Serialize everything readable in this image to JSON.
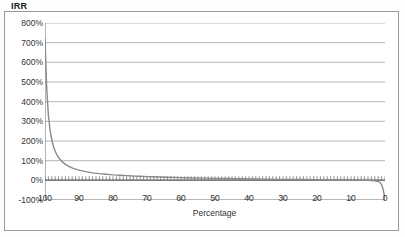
{
  "chart_title": "IRR",
  "x_axis_title": "Percentage",
  "colors": {
    "curve": "#8a8a8a",
    "gridline": "#b4b4b4",
    "axis": "#6e6e6e",
    "frame": "#9a9a9a",
    "text": "#333333",
    "background": "#ffffff"
  },
  "chart_data": {
    "type": "line",
    "title": "IRR",
    "xlabel": "Percentage",
    "ylabel": "",
    "xlim": [
      100,
      0
    ],
    "ylim": [
      -100,
      800
    ],
    "x_reversed": true,
    "grid": true,
    "legend": "none",
    "ytick_labels": [
      "800%",
      "700%",
      "600%",
      "500%",
      "400%",
      "300%",
      "200%",
      "100%",
      "0%",
      "-100%"
    ],
    "ytick_values": [
      800,
      700,
      600,
      500,
      400,
      300,
      200,
      100,
      0,
      -100
    ],
    "ytick_suffix": "%",
    "ytick_step": 100,
    "xtick_labels": [
      "100",
      "90",
      "80",
      "70",
      "60",
      "50",
      "40",
      "30",
      "20",
      "10",
      "0"
    ],
    "xtick_values": [
      100,
      90,
      80,
      70,
      60,
      50,
      40,
      30,
      20,
      10,
      0
    ],
    "xtick_step": 10,
    "minor_xtick_step": 1,
    "series": [
      {
        "name": "IRR",
        "x": [
          100,
          99.5,
          99,
          98.5,
          98,
          97.5,
          97,
          96.5,
          96,
          95,
          94,
          93,
          92,
          91,
          90,
          88,
          86,
          84,
          82,
          80,
          78,
          76,
          74,
          72,
          70,
          68,
          66,
          64,
          62,
          60,
          58,
          56,
          54,
          52,
          50,
          48,
          46,
          44,
          42,
          40,
          38,
          36,
          34,
          32,
          30,
          28,
          26,
          24,
          22,
          20,
          18,
          16,
          14,
          12,
          10,
          8,
          6,
          5,
          4,
          3,
          2,
          1.5,
          1,
          0.6,
          0.3,
          0.1,
          0
        ],
        "y": [
          720,
          470,
          330,
          255,
          205,
          172,
          148,
          130,
          116,
          95,
          81,
          71,
          63,
          57,
          52,
          44,
          38,
          34,
          31,
          28,
          26,
          24,
          22,
          21,
          19,
          18,
          17,
          16,
          15,
          14,
          13,
          12,
          11,
          11,
          10,
          9,
          9,
          8,
          8,
          7,
          7,
          6,
          6,
          5,
          5,
          5,
          4,
          4,
          3,
          3,
          3,
          2,
          2,
          2,
          1,
          1,
          0,
          0,
          -1,
          -2,
          -6,
          -11,
          -22,
          -42,
          -68,
          -92,
          -100
        ]
      }
    ],
    "annotations": [
      "Curve starts near 720% at 100% and decays hyperbolically toward 0%",
      "Curve plunges steeply to -100% as Percentage approaches 0"
    ]
  }
}
